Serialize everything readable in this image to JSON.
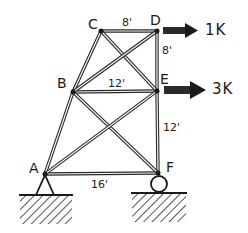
{
  "diagram": {
    "type": "truss",
    "nodes": [
      {
        "id": "A",
        "label": "A",
        "x": 45,
        "y": 174
      },
      {
        "id": "B",
        "label": "B",
        "x": 73,
        "y": 92
      },
      {
        "id": "C",
        "label": "C",
        "x": 101,
        "y": 31
      },
      {
        "id": "D",
        "label": "D",
        "x": 157,
        "y": 31
      },
      {
        "id": "E",
        "label": "E",
        "x": 157,
        "y": 91
      },
      {
        "id": "F",
        "label": "F",
        "x": 158,
        "y": 173
      }
    ],
    "members": [
      [
        "A",
        "B"
      ],
      [
        "B",
        "C"
      ],
      [
        "C",
        "D"
      ],
      [
        "D",
        "E"
      ],
      [
        "E",
        "F"
      ],
      [
        "A",
        "F"
      ],
      [
        "B",
        "E"
      ],
      [
        "C",
        "E"
      ],
      [
        "B",
        "D"
      ],
      [
        "B",
        "F"
      ],
      [
        "A",
        "E"
      ]
    ],
    "dimensions": {
      "CD": "8'",
      "DE": "8'",
      "BE": "12'",
      "EF": "12'",
      "AF": "16'"
    },
    "loads": [
      {
        "node": "D",
        "label": "1K",
        "direction": "right"
      },
      {
        "node": "E",
        "label": "3K",
        "direction": "right"
      }
    ],
    "supports": [
      {
        "node": "A",
        "type": "pin"
      },
      {
        "node": "F",
        "type": "roller"
      }
    ],
    "colors": {
      "ink": "#1a1a1a",
      "background": "#ffffff"
    }
  }
}
